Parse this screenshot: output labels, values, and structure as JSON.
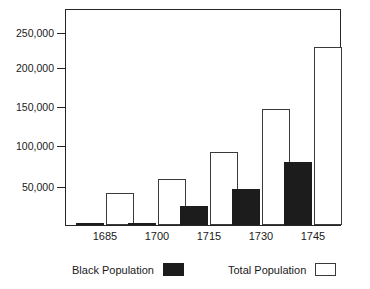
{
  "chart_data": {
    "type": "bar",
    "title": "",
    "subtitle": "",
    "xlabel": "",
    "ylabel": "",
    "categories": [
      "1685",
      "1700",
      "1715",
      "1730",
      "1745"
    ],
    "series": [
      {
        "name": "Black Population",
        "color": "#1c1c1c",
        "fill": "solid",
        "values": [
          2000,
          3000,
          25000,
          46000,
          82000
        ]
      },
      {
        "name": "Total Population",
        "color": "#ffffff",
        "fill": "outline",
        "values": [
          41000,
          60000,
          94000,
          150000,
          230000
        ]
      }
    ],
    "ylim": [
      0,
      278000
    ],
    "yticks": [
      50000,
      100000,
      150000,
      200000,
      250000
    ],
    "ytick_labels": [
      "50,000",
      "100,000",
      "150,000",
      "200,000",
      "250,000"
    ],
    "grid": false,
    "legend_position": "bottom",
    "frame": true
  },
  "legend": {
    "items": [
      {
        "label": "Black Population",
        "swatch": "black-filled-swatch"
      },
      {
        "label": "Total Population",
        "swatch": "white-outlined-swatch"
      }
    ]
  },
  "axis": {
    "y_labels": [
      "250,000",
      "200,000",
      "150,000",
      "100,000",
      "50,000"
    ],
    "x_labels": [
      "1685",
      "1700",
      "1715",
      "1730",
      "1745"
    ]
  }
}
